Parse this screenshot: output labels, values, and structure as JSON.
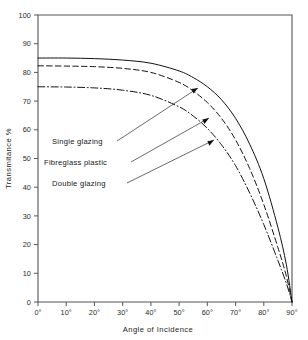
{
  "figure": {
    "cropped_header_fragment": "",
    "background_color": "#ffffff",
    "ink_color": "#111111"
  },
  "axes": {
    "y_title": "Transmitance %",
    "x_title": "Angle of Incidence",
    "y_ticks": [
      "0",
      "10",
      "20",
      "30",
      "40",
      "50",
      "60",
      "70",
      "80",
      "90",
      "100"
    ],
    "x_ticks": [
      "0°",
      "10°",
      "20°",
      "30°",
      "40°",
      "50°",
      "60°",
      "70°",
      "80°",
      "90°"
    ]
  },
  "annotations": [
    {
      "id": "single-glazing",
      "label": "Single glazing"
    },
    {
      "id": "fibreglass-plastic",
      "label": "Fibreglass plastic"
    },
    {
      "id": "double-glazing",
      "label": "Double glazing"
    }
  ],
  "chart_data": {
    "type": "line",
    "title": "",
    "subtitle": "",
    "xlabel": "Angle of Incidence",
    "ylabel": "Transmitance %",
    "xlim": [
      0,
      90
    ],
    "ylim": [
      0,
      100
    ],
    "xtick_values": [
      0,
      10,
      20,
      30,
      40,
      50,
      60,
      70,
      80,
      90
    ],
    "ytick_values": [
      0,
      10,
      20,
      30,
      40,
      50,
      60,
      70,
      80,
      90,
      100
    ],
    "xtick_labels": [
      "0°",
      "10°",
      "20°",
      "30°",
      "40°",
      "50°",
      "60°",
      "70°",
      "80°",
      "90°"
    ],
    "grid": false,
    "legend": "annotated-leader-lines",
    "legend_position": "inside-left",
    "x": [
      0,
      10,
      20,
      30,
      40,
      50,
      55,
      60,
      65,
      70,
      75,
      80,
      85,
      88,
      90
    ],
    "series": [
      {
        "name": "Single glazing",
        "style": "solid",
        "color": "#111111",
        "values": [
          85,
          85,
          84.8,
          84.3,
          83.2,
          80.5,
          78.2,
          75.0,
          70.5,
          64.0,
          55.0,
          43.0,
          26.0,
          13.0,
          0
        ]
      },
      {
        "name": "Double glazing",
        "style": "dashed",
        "color": "#111111",
        "values": [
          82.3,
          82.2,
          82.0,
          81.4,
          80.0,
          76.5,
          73.5,
          69.5,
          64.0,
          56.5,
          46.5,
          34.0,
          19.0,
          9.0,
          0
        ]
      },
      {
        "name": "Fibreglass plastic",
        "style": "dash-dot",
        "color": "#111111",
        "values": [
          75.0,
          74.9,
          74.6,
          73.8,
          72.0,
          68.0,
          64.8,
          60.5,
          54.8,
          47.5,
          38.0,
          27.0,
          14.5,
          6.5,
          0
        ]
      }
    ]
  }
}
